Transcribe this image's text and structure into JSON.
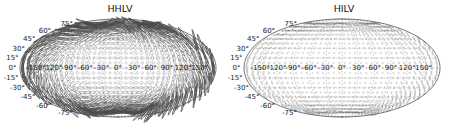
{
  "figure": {
    "width": 449,
    "height": 131,
    "background": "#ffffff",
    "line_color": "#4a4a4a",
    "grid_color": "#7a7a7a",
    "limb_color": "#3a3a3a"
  },
  "panels": [
    {
      "id": "hhlv",
      "title": "HHLV",
      "projection": "mollweide",
      "lat_ticks": [
        "75°",
        "60°",
        "45°",
        "30°",
        "15°",
        "0°",
        "-15°",
        "-30°",
        "-45°",
        "-60°",
        "-75°"
      ],
      "lat_values": [
        75,
        60,
        45,
        30,
        15,
        0,
        -15,
        -30,
        -45,
        -60,
        -75
      ],
      "lon_ticks": [
        "-150°",
        "-120°",
        "-90°",
        "-60°",
        "-30°",
        "0°",
        "30°",
        "60°",
        "90°",
        "120°",
        "150°"
      ],
      "lon_values": [
        -150,
        -120,
        -90,
        -60,
        -30,
        0,
        30,
        60,
        90,
        120,
        150
      ],
      "marker_style": "polarization-ellipse",
      "marker_contrast": "high",
      "marker_seed": 11
    },
    {
      "id": "hilv",
      "title": "HILV",
      "projection": "mollweide",
      "lat_ticks": [
        "75°",
        "60°",
        "45°",
        "30°",
        "15°",
        "0°",
        "-15°",
        "-30°",
        "-45°",
        "-60°",
        "-75°"
      ],
      "lat_values": [
        75,
        60,
        45,
        30,
        15,
        0,
        -15,
        -30,
        -45,
        -60,
        -75
      ],
      "lon_ticks": [
        "-150°",
        "-120°",
        "-90°",
        "-60°",
        "-30°",
        "0°",
        "30°",
        "60°",
        "90°",
        "120°",
        "150°"
      ],
      "lon_values": [
        -150,
        -120,
        -90,
        -60,
        -30,
        0,
        30,
        60,
        90,
        120,
        150
      ],
      "marker_style": "polarization-ellipse",
      "marker_contrast": "low",
      "marker_seed": 29
    }
  ],
  "chart_data": {
    "type": "scatter",
    "subplots": [
      "HHLV",
      "HILV"
    ],
    "xlabel": "Longitude",
    "ylabel": "Latitude",
    "xlim": [
      -180,
      180
    ],
    "ylim": [
      -90,
      90
    ],
    "grid": true,
    "legend": "none",
    "x": [
      -150,
      -120,
      -90,
      -60,
      -30,
      0,
      30,
      60,
      90,
      120,
      150
    ],
    "y": [
      75,
      60,
      45,
      30,
      15,
      0,
      -15,
      -30,
      -45,
      -60,
      -75
    ],
    "series": [
      {
        "name": "HHLV",
        "description": "Grid of polarization ellipses / elongated bars across the sky; strongly elongated streaks concentrated toward the eastern and western limbs and near the poles.",
        "marker_sizes_min": 0.6,
        "marker_sizes_max": 9.0
      },
      {
        "name": "HILV",
        "description": "Grid of polarization ellipses; markers are smaller and more uniformly dot-like, with mild elongation increasing toward the limbs.",
        "marker_sizes_min": 0.4,
        "marker_sizes_max": 5.0
      }
    ]
  }
}
